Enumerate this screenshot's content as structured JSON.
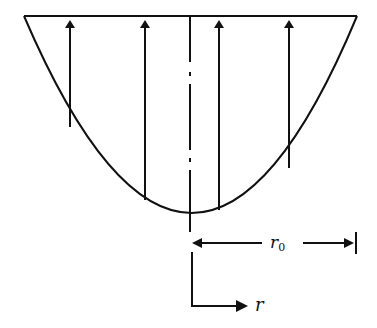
{
  "diagram": {
    "type": "velocity-profile",
    "colors": {
      "ink": "#111111",
      "background": "#ffffff"
    },
    "top_line": {
      "x1": 24,
      "x2": 357,
      "y": 16
    },
    "parabola": {
      "left_x": 24,
      "right_x": 357,
      "top_y": 16,
      "vertex_x": 193,
      "vertex_y": 213
    },
    "center_line": {
      "x": 190,
      "y1": 16,
      "y2": 306,
      "style": "dash-dot"
    },
    "arrows": [
      {
        "x": 70,
        "y_base": 127
      },
      {
        "x": 145,
        "y_base": 200
      },
      {
        "x": 219,
        "y_base": 210
      },
      {
        "x": 289,
        "y_base": 168
      }
    ],
    "dimension": {
      "label": "r",
      "subscript": "0",
      "y": 243,
      "x1": 192,
      "x2": 355
    },
    "axis": {
      "label": "r",
      "origin_x": 192,
      "corner_y": 306,
      "end_x": 248
    }
  }
}
